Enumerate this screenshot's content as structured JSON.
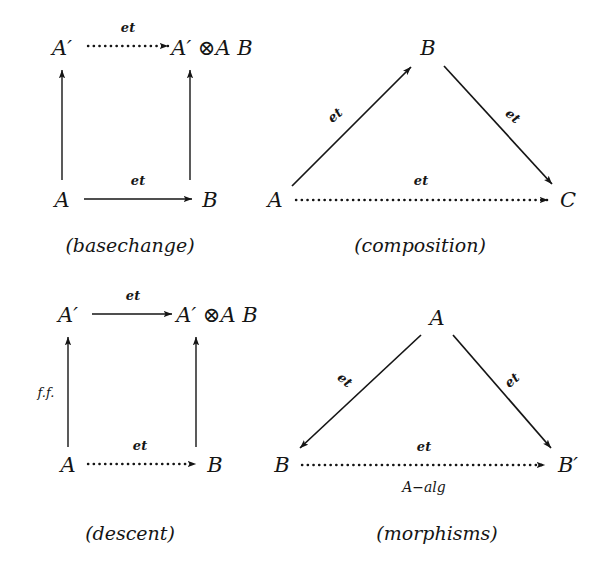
{
  "figure": {
    "background": "#ffffff",
    "ink": "#151515",
    "diagrams": [
      {
        "id": "basechange",
        "caption": "(basechange)",
        "caption_pos": {
          "x": 130,
          "y": 245
        },
        "shape": "square",
        "nodes": [
          {
            "name": "node-a-prime",
            "label": "A′",
            "x": 62,
            "y": 48,
            "parts": {
              "base": "A",
              "prime": "′"
            }
          },
          {
            "name": "node-a-prime-tensor-b",
            "label": "A′ ⊗A B",
            "x": 210,
            "y": 48,
            "parts": {
              "base": "A",
              "prime": "′",
              "tensor": "⊗",
              "sub": "A",
              "right": "B"
            }
          },
          {
            "name": "node-a",
            "label": "A",
            "x": 62,
            "y": 200
          },
          {
            "name": "node-b",
            "label": "B",
            "x": 210,
            "y": 200
          }
        ],
        "edges": [
          {
            "name": "edge-top",
            "from": "A′",
            "to": "A′ ⊗A B",
            "label": "et",
            "style": "dotted",
            "x1": 88,
            "y1": 46,
            "x2": 168,
            "y2": 46,
            "lx": 128,
            "ly": 27
          },
          {
            "name": "edge-bottom",
            "from": "A",
            "to": "B",
            "label": "et",
            "style": "solid",
            "x1": 84,
            "y1": 199,
            "x2": 192,
            "y2": 199,
            "lx": 138,
            "ly": 180
          },
          {
            "name": "edge-left",
            "from": "A",
            "to": "A′",
            "label": "",
            "style": "solid",
            "x1": 62,
            "y1": 180,
            "x2": 62,
            "y2": 70,
            "lx": 0,
            "ly": 0
          },
          {
            "name": "edge-right",
            "from": "B",
            "to": "A′ ⊗A B",
            "label": "",
            "style": "solid",
            "x1": 190,
            "y1": 180,
            "x2": 190,
            "y2": 70,
            "lx": 0,
            "ly": 0
          }
        ]
      },
      {
        "id": "composition",
        "caption": "(composition)",
        "caption_pos": {
          "x": 420,
          "y": 245
        },
        "shape": "triangle",
        "nodes": [
          {
            "name": "node-b-apex",
            "label": "B",
            "x": 428,
            "y": 48
          },
          {
            "name": "node-a",
            "label": "A",
            "x": 275,
            "y": 200
          },
          {
            "name": "node-c",
            "label": "C",
            "x": 568,
            "y": 200
          }
        ],
        "edges": [
          {
            "name": "edge-a-to-b",
            "from": "A",
            "to": "B",
            "label": "et",
            "style": "solid",
            "x1": 292,
            "y1": 186,
            "x2": 411,
            "y2": 67,
            "lx": 335,
            "ly": 115
          },
          {
            "name": "edge-b-to-c",
            "from": "B",
            "to": "C",
            "label": "et",
            "style": "solid",
            "x1": 444,
            "y1": 66,
            "x2": 552,
            "y2": 184,
            "lx": 513,
            "ly": 116
          },
          {
            "name": "edge-a-to-c",
            "from": "A",
            "to": "C",
            "label": "et",
            "style": "dotted",
            "x1": 296,
            "y1": 200,
            "x2": 548,
            "y2": 200,
            "lx": 421,
            "ly": 180
          }
        ]
      },
      {
        "id": "descent",
        "caption": "(descent)",
        "caption_pos": {
          "x": 130,
          "y": 533
        },
        "shape": "square",
        "nodes": [
          {
            "name": "node-a-prime",
            "label": "A′",
            "x": 68,
            "y": 315,
            "parts": {
              "base": "A",
              "prime": "′"
            }
          },
          {
            "name": "node-a-prime-tensor-b",
            "label": "A′ ⊗A B",
            "x": 215,
            "y": 315,
            "parts": {
              "base": "A",
              "prime": "′",
              "tensor": "⊗",
              "sub": "A",
              "right": "B"
            }
          },
          {
            "name": "node-a",
            "label": "A",
            "x": 68,
            "y": 465
          },
          {
            "name": "node-b",
            "label": "B",
            "x": 215,
            "y": 465
          }
        ],
        "edges": [
          {
            "name": "edge-top",
            "from": "A′",
            "to": "A′ ⊗A B",
            "label": "et",
            "style": "solid",
            "x1": 92,
            "y1": 314,
            "x2": 172,
            "y2": 314,
            "lx": 133,
            "ly": 295
          },
          {
            "name": "edge-bottom",
            "from": "A",
            "to": "B",
            "label": "et",
            "style": "dotted",
            "x1": 88,
            "y1": 464,
            "x2": 196,
            "y2": 464,
            "lx": 140,
            "ly": 445
          },
          {
            "name": "edge-left",
            "from": "A",
            "to": "A′",
            "label": "f.f.",
            "style": "solid",
            "x1": 68,
            "y1": 447,
            "x2": 68,
            "y2": 337,
            "lx": 46,
            "ly": 392
          },
          {
            "name": "edge-right",
            "from": "B",
            "to": "A′ ⊗A B",
            "label": "",
            "style": "solid",
            "x1": 196,
            "y1": 447,
            "x2": 196,
            "y2": 337,
            "lx": 0,
            "ly": 0
          }
        ]
      },
      {
        "id": "morphisms",
        "caption": "(morphisms)",
        "caption_pos": {
          "x": 437,
          "y": 533
        },
        "shape": "triangle",
        "nodes": [
          {
            "name": "node-a-apex",
            "label": "A",
            "x": 437,
            "y": 318
          },
          {
            "name": "node-b",
            "label": "B",
            "x": 282,
            "y": 465
          },
          {
            "name": "node-b-prime",
            "label": "B′",
            "x": 566,
            "y": 465,
            "parts": {
              "base": "B",
              "prime": "′"
            }
          }
        ],
        "edges": [
          {
            "name": "edge-a-to-b",
            "from": "A",
            "to": "B",
            "label": "et",
            "style": "solid",
            "x1": 421,
            "y1": 335,
            "x2": 300,
            "y2": 448,
            "lx": 345,
            "ly": 380
          },
          {
            "name": "edge-a-to-b-prime",
            "from": "A",
            "to": "B′",
            "label": "et",
            "style": "solid",
            "x1": 453,
            "y1": 335,
            "x2": 551,
            "y2": 448,
            "lx": 512,
            "ly": 380
          },
          {
            "name": "edge-b-to-b-prime",
            "from": "B",
            "to": "B′",
            "label": "et",
            "style": "dotted",
            "x1": 302,
            "y1": 465,
            "x2": 545,
            "y2": 465,
            "lx": 424,
            "ly": 446
          },
          {
            "name": "edge-b-to-b-prime-sub",
            "from": "B",
            "to": "B′",
            "label": "A−alg",
            "style": "none",
            "x1": 0,
            "y1": 0,
            "x2": 0,
            "y2": 0,
            "lx": 424,
            "ly": 487
          }
        ]
      }
    ]
  }
}
